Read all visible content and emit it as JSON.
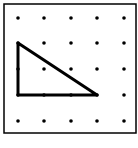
{
  "diagram": {
    "type": "geoboard",
    "grid": {
      "rows": 5,
      "cols": 5
    },
    "dot_x": [
      18,
      44,
      71,
      97,
      124
    ],
    "dot_y": [
      18,
      43,
      69,
      95,
      121
    ],
    "border": {
      "x": 4,
      "y": 4,
      "width": 132,
      "height": 129
    },
    "shape": {
      "name": "right-triangle",
      "vertices_grid": [
        [
          0,
          1
        ],
        [
          0,
          3
        ],
        [
          3,
          3
        ]
      ],
      "stroke": "#000000",
      "stroke_width": 3
    },
    "colors": {
      "dot": "#000000",
      "border": "#000000",
      "background": "#ffffff"
    }
  }
}
